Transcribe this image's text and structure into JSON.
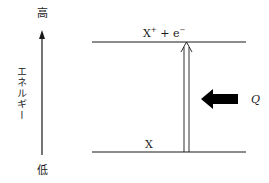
{
  "axis": {
    "high_label": "高",
    "low_label": "低",
    "title": "エネルギー"
  },
  "levels": {
    "upper": {
      "base": "X",
      "sup1": "+",
      "plus": " + ",
      "e": "e",
      "sup2": "−"
    },
    "lower": {
      "label": "X"
    }
  },
  "energy_arrow": {
    "label": "Q"
  },
  "colors": {
    "line": "#1a1a1a",
    "background": "#ffffff"
  }
}
